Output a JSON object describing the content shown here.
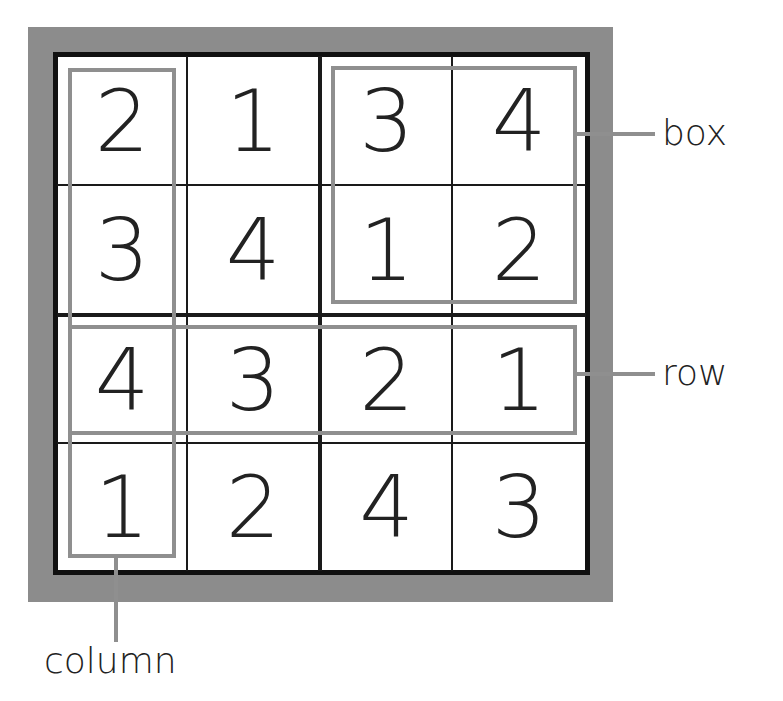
{
  "grid": {
    "rows": [
      [
        "2",
        "1",
        "3",
        "4"
      ],
      [
        "3",
        "4",
        "1",
        "2"
      ],
      [
        "4",
        "3",
        "2",
        "1"
      ],
      [
        "1",
        "2",
        "4",
        "3"
      ]
    ]
  },
  "labels": {
    "box": "box",
    "row": "row",
    "column": "column"
  },
  "colors": {
    "frame": "#8c8c8c",
    "highlight": "#8f8f8f",
    "grid_line": "#1a1a1a",
    "digit": "#222222"
  }
}
